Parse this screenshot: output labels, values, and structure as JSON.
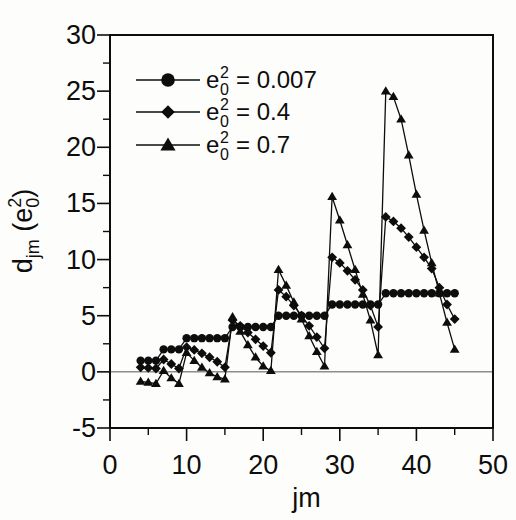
{
  "figure": {
    "background": "#fdfdfb",
    "ink_color": "#0d0d0d",
    "zero_line_color": "#555555"
  },
  "chart_data": {
    "type": "line",
    "title": "",
    "xlabel": "jm",
    "ylabel": {
      "base": "d",
      "base_sub": "jm",
      "paren_pre": " (e",
      "sup": "2",
      "sub": "0",
      "paren_post": ")"
    },
    "xlim": [
      0,
      50
    ],
    "ylim": [
      -5,
      30
    ],
    "x_major_ticks": [
      0,
      10,
      20,
      30,
      40,
      50
    ],
    "x_minor_ticks": [
      5,
      15,
      25,
      35,
      45
    ],
    "y_major_ticks": [
      30,
      25,
      20,
      15,
      10,
      5,
      0,
      -5
    ],
    "y_minor_ticks": [
      27.5,
      22.5,
      17.5,
      12.5,
      7.5,
      2.5,
      -2.5
    ],
    "grid": false,
    "zero_line": true,
    "frame": true,
    "legend_position": "top-left-inside",
    "legend": [
      {
        "marker": "circle",
        "pre": "e",
        "sup": "2",
        "sub": "0",
        "rest": "= 0.007"
      },
      {
        "marker": "diamond",
        "pre": "e",
        "sup": "2",
        "sub": "0",
        "rest": "= 0.4"
      },
      {
        "marker": "triangle",
        "pre": "e",
        "sup": "2",
        "sub": "0",
        "rest": "= 0.7"
      }
    ],
    "x": [
      4,
      5,
      6,
      7,
      8,
      9,
      10,
      11,
      12,
      13,
      14,
      15,
      16,
      17,
      18,
      19,
      20,
      21,
      22,
      23,
      24,
      25,
      26,
      27,
      28,
      29,
      30,
      31,
      32,
      33,
      34,
      35,
      36,
      37,
      38,
      39,
      40,
      41,
      42,
      43,
      44,
      45
    ],
    "series": [
      {
        "name": "e0^2 = 0.007",
        "marker": "circle",
        "values": [
          1,
          1,
          1,
          2,
          2,
          2,
          3,
          3,
          3,
          3,
          3,
          3,
          4,
          4,
          4,
          4,
          4,
          4,
          5,
          5,
          5,
          5,
          5,
          5,
          5,
          6,
          6,
          6,
          6,
          6,
          6,
          6,
          7,
          7,
          7,
          7,
          7,
          7,
          7,
          7,
          7,
          7
        ]
      },
      {
        "name": "e0^2 = 0.4",
        "marker": "diamond",
        "values": [
          0.4,
          0.35,
          0.3,
          1.1,
          0.7,
          0.3,
          2.2,
          1.95,
          1.65,
          1.3,
          0.9,
          0.4,
          4.6,
          4.1,
          3.5,
          2.9,
          2.3,
          1.7,
          7.3,
          6.7,
          5.9,
          5.0,
          4.1,
          3.1,
          2.1,
          10.2,
          9.7,
          9.0,
          8.2,
          7.3,
          5.9,
          4.0,
          13.8,
          13.4,
          12.8,
          12.0,
          11.1,
          10.2,
          9.2,
          7.5,
          6.0,
          4.7
        ]
      },
      {
        "name": "e0^2 = 0.7",
        "marker": "triangle",
        "values": [
          -0.85,
          -0.95,
          -1.05,
          0.1,
          -0.55,
          -1.05,
          1.7,
          1.0,
          0.4,
          -0.1,
          -0.45,
          -0.65,
          4.9,
          3.6,
          2.4,
          1.3,
          0.5,
          0.1,
          9.1,
          7.7,
          6.2,
          4.7,
          3.2,
          1.8,
          0.5,
          15.6,
          13.5,
          11.3,
          9.1,
          6.9,
          4.6,
          1.5,
          25.0,
          24.5,
          22.5,
          19.3,
          15.8,
          12.6,
          9.7,
          7.0,
          4.4,
          2.0
        ]
      }
    ]
  }
}
